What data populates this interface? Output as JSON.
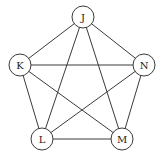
{
  "diagram": {
    "type": "complete-graph",
    "nodes": [
      {
        "id": "J",
        "label": "J",
        "x": 83,
        "y": 17
      },
      {
        "id": "K",
        "label": "K",
        "x": 20,
        "y": 65
      },
      {
        "id": "N",
        "label": "N",
        "x": 144,
        "y": 65
      },
      {
        "id": "L",
        "label": "L",
        "x": 42,
        "y": 139
      },
      {
        "id": "M",
        "label": "M",
        "x": 122,
        "y": 139
      }
    ],
    "edges": [
      [
        "J",
        "K"
      ],
      [
        "J",
        "N"
      ],
      [
        "J",
        "L"
      ],
      [
        "J",
        "M"
      ],
      [
        "K",
        "N"
      ],
      [
        "K",
        "L"
      ],
      [
        "K",
        "M"
      ],
      [
        "N",
        "L"
      ],
      [
        "N",
        "M"
      ],
      [
        "L",
        "M"
      ]
    ],
    "node_radius": 11,
    "colors": {
      "stroke": "#3a3a3a",
      "fill": "#ffffff",
      "text": "#222222"
    }
  }
}
